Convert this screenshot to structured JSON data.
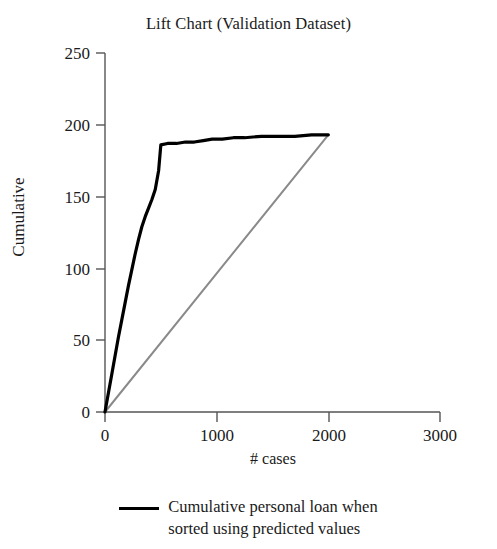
{
  "chart_data": {
    "type": "line",
    "title": "Lift Chart (Validation Dataset)",
    "xlabel": "# cases",
    "ylabel": "Cumulative",
    "xlim": [
      0,
      3000
    ],
    "ylim": [
      0,
      250
    ],
    "xticks": [
      "0",
      "1000",
      "2000",
      "3000"
    ],
    "xtick_values": [
      0,
      1000,
      2000,
      3000
    ],
    "yticks": [
      "0",
      "50",
      "100",
      "150",
      "200",
      "250"
    ],
    "ytick_values": [
      0,
      50,
      100,
      150,
      200,
      250
    ],
    "grid": false,
    "legend_position": "bottom-center",
    "series": [
      {
        "name": "Cumulative personal loan when sorted using predicted values",
        "color": "#000000",
        "width": 3.2,
        "x": [
          0,
          30,
          60,
          90,
          120,
          150,
          180,
          210,
          240,
          270,
          300,
          330,
          360,
          390,
          420,
          450,
          480,
          500,
          560,
          640,
          720,
          800,
          880,
          960,
          1050,
          1150,
          1250,
          1400,
          1550,
          1700,
          1850,
          2000
        ],
        "y": [
          0,
          13,
          26,
          39,
          52,
          64,
          76,
          88,
          99,
          110,
          120,
          129,
          136,
          142,
          148,
          155,
          168,
          186,
          187,
          187,
          188,
          188,
          189,
          190,
          190,
          191,
          191,
          192,
          192,
          192,
          193,
          193
        ]
      },
      {
        "name": "baseline",
        "color": "#8a8a8a",
        "width": 2.0,
        "x": [
          0,
          2000
        ],
        "y": [
          0,
          193
        ]
      }
    ]
  },
  "legend": {
    "swatch_icon": "line-swatch-icon",
    "line1": "Cumulative personal loan when",
    "line2": "sorted using predicted values"
  },
  "colors": {
    "curve": "#000000",
    "baseline": "#8a8a8a",
    "axis": "#555555",
    "text": "#1a1a1a",
    "background": "#ffffff"
  }
}
